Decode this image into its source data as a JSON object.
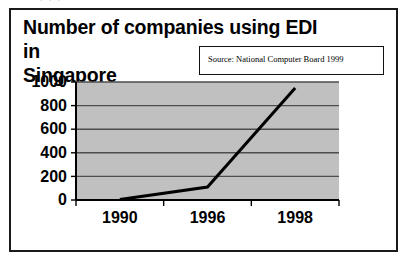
{
  "clipped_text_above": ". . .",
  "figure": {
    "title_line1": "Number of companies using EDI in",
    "title_line2": "Singapore",
    "source_note": "Source: National Computer Board 1999"
  },
  "chart_data": {
    "type": "line",
    "title": "Number of companies using EDI in Singapore",
    "subtitle": "Source: National Computer Board 1999",
    "xlabel": "",
    "ylabel": "",
    "categories": [
      "1990",
      "1996",
      "1998"
    ],
    "values": [
      5,
      110,
      950
    ],
    "series": [
      {
        "name": "Companies using EDI",
        "values": [
          5,
          110,
          950
        ]
      }
    ],
    "ylim": [
      0,
      1000
    ],
    "yticks": [
      0,
      200,
      400,
      600,
      800,
      1000
    ],
    "ytick_labels": [
      "0",
      "200",
      "400",
      "600",
      "800",
      "1000"
    ],
    "xtick_labels": [
      "1990",
      "1996",
      "1998"
    ],
    "grid": "horizontal",
    "legend": "none",
    "plot_background": "#c0c0c0",
    "line_color": "#000000",
    "gridline_color": "#4d4d4d",
    "axis_color": "#000000"
  }
}
